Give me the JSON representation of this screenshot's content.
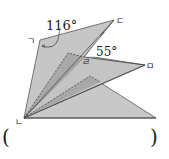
{
  "diagram": {
    "type": "folded-paper-geometry",
    "angles": [
      {
        "label": "116°",
        "at": "vertex-giyeok"
      },
      {
        "label": "55°",
        "at": "vertex-rieul"
      }
    ],
    "points": {
      "giyeok": "ㄱ",
      "nieun": "ㄴ",
      "digeut": "ㄷ",
      "rieul": "ㄹ",
      "mieum": "ㅁ"
    },
    "answer_blank": {
      "open": "(",
      "close": ")"
    }
  }
}
